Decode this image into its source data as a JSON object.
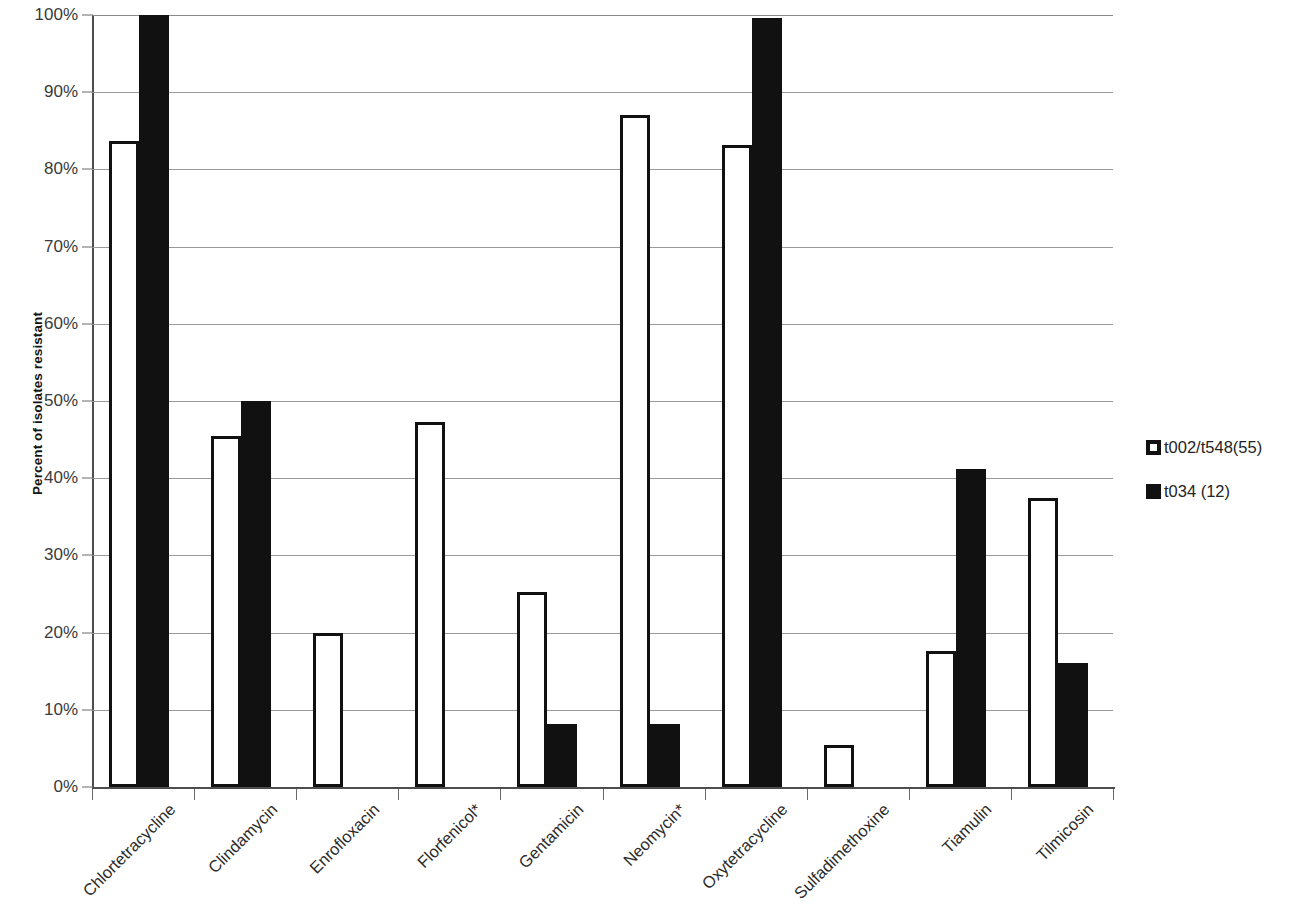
{
  "chart_data": {
    "type": "bar",
    "title": "",
    "subtitle": "",
    "xlabel": "",
    "ylabel": "Percent of isolates resistant",
    "ylim": [
      0,
      100
    ],
    "y_tick_labels": [
      "0%",
      "10%",
      "20%",
      "30%",
      "40%",
      "50%",
      "60%",
      "70%",
      "80%",
      "90%",
      "100%"
    ],
    "y_tick_values": [
      0,
      10,
      20,
      30,
      40,
      50,
      60,
      70,
      80,
      90,
      100
    ],
    "grid": "horizontal",
    "legend_position": "right",
    "categories": [
      "Chlortetracycline",
      "Clindamycin",
      "Enrofloxacin",
      "Florfenicol*",
      "Gentamicin",
      "Neomycin*",
      "Oxytetracycline",
      "Sulfadimethoxine",
      "Tiamulin",
      "Tilmicosin"
    ],
    "series": [
      {
        "name": "t002/t548(55)",
        "fill": "#ffffff",
        "edge": "#111111",
        "values": [
          83.7,
          45.5,
          20.0,
          47.3,
          25.2,
          87.0,
          83.2,
          5.4,
          17.6,
          37.5
        ]
      },
      {
        "name": "t034 (12)",
        "fill": "#111111",
        "edge": "#111111",
        "values": [
          100.0,
          50.0,
          0,
          0,
          8.2,
          8.1,
          99.6,
          0,
          41.2,
          16.0
        ]
      }
    ],
    "annotations": []
  },
  "legend": {
    "items": [
      {
        "label": "t002/t548(55)",
        "style": "light"
      },
      {
        "label": "t034 (12)",
        "style": "dark"
      }
    ]
  }
}
